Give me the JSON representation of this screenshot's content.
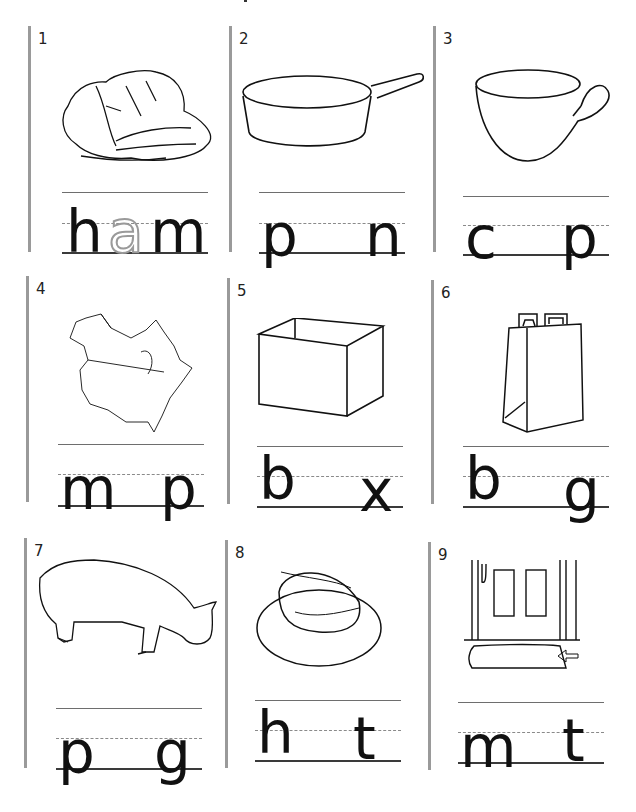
{
  "worksheet": {
    "items": [
      {
        "number": "1",
        "picture": "ham",
        "letters": [
          "h",
          "a",
          "m"
        ],
        "traced_letter": "a",
        "blank": false
      },
      {
        "number": "2",
        "picture": "pan",
        "letters": [
          "p",
          "",
          "n"
        ],
        "blank": true
      },
      {
        "number": "3",
        "picture": "cup",
        "letters": [
          "c",
          "",
          "p"
        ],
        "blank": true
      },
      {
        "number": "4",
        "picture": "map",
        "letters": [
          "m",
          "",
          "p"
        ],
        "blank": true
      },
      {
        "number": "5",
        "picture": "box",
        "letters": [
          "b",
          "",
          "x"
        ],
        "blank": true
      },
      {
        "number": "6",
        "picture": "bag",
        "letters": [
          "b",
          "",
          "g"
        ],
        "blank": true
      },
      {
        "number": "7",
        "picture": "pig",
        "letters": [
          "p",
          "",
          "g"
        ],
        "blank": true
      },
      {
        "number": "8",
        "picture": "hat",
        "letters": [
          "h",
          "",
          "t"
        ],
        "blank": true
      },
      {
        "number": "9",
        "picture": "mat",
        "letters": [
          "m",
          "",
          "t"
        ],
        "blank": true
      }
    ]
  }
}
